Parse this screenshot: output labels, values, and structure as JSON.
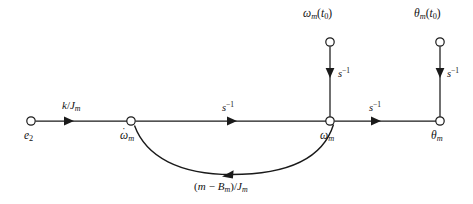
{
  "figure": {
    "kind": "signal-flow-graph",
    "title": "",
    "background_color": "#ffffff",
    "line_color": "#1a1a1a",
    "canvas": {
      "width": 473,
      "height": 204
    }
  },
  "nodes": [
    {
      "id": "e2",
      "label_plain": "e2",
      "label_base": "e",
      "label_sub": "2",
      "role": "source",
      "x": 31,
      "y": 121,
      "label_x": 24,
      "label_y": 130
    },
    {
      "id": "omega_dot_m",
      "label_plain": "omega-dot m",
      "label_base": "ω",
      "label_sub": "m",
      "label_dot": "·",
      "role": "state-node",
      "x": 131,
      "y": 121,
      "label_x": 120,
      "label_y": 130
    },
    {
      "id": "omega_m",
      "label_plain": "omega m",
      "label_base": "ω",
      "label_sub": "m",
      "role": "state-node",
      "x": 330,
      "y": 121,
      "label_x": 320,
      "label_y": 130
    },
    {
      "id": "theta_m",
      "label_plain": "theta m",
      "label_base": "θ",
      "label_sub": "m",
      "role": "output",
      "x": 440,
      "y": 121,
      "label_x": 431,
      "label_y": 130
    },
    {
      "id": "omega_m_t0",
      "label_plain": "omega m (t0)",
      "label_base": "ω",
      "label_sub": "m",
      "label_tail_open": "(",
      "label_tail_var": "t",
      "label_tail_sub": "0",
      "label_tail_close": ")",
      "role": "initial-condition-source",
      "x": 330,
      "y": 42,
      "label_x": 303,
      "label_y": 8
    },
    {
      "id": "theta_m_t0",
      "label_plain": "theta m (t0)",
      "label_base": "θ",
      "label_sub": "m",
      "label_tail_open": "(",
      "label_tail_var": "t",
      "label_tail_sub": "0",
      "label_tail_close": ")",
      "role": "initial-condition-source",
      "x": 440,
      "y": 42,
      "label_x": 414,
      "label_y": 8
    }
  ],
  "branches": [
    {
      "id": "branch-e2-to-omegadot",
      "from": "e2",
      "to": "omega_dot_m",
      "gain_plain": "k/Jm",
      "gain_num": "k",
      "gain_slash": "/",
      "gain_den": "J",
      "gain_den_sub": "m",
      "shape": "straight-horizontal",
      "direction": "right",
      "label_x": 62,
      "label_y": 100
    },
    {
      "id": "branch-omegadot-to-omega",
      "from": "omega_dot_m",
      "to": "omega_m",
      "gain_plain": "s^-1",
      "gain_base": "s",
      "gain_exp": "−1",
      "shape": "straight-horizontal",
      "direction": "right",
      "label_x": 222,
      "label_y": 101
    },
    {
      "id": "branch-omega-to-theta",
      "from": "omega_m",
      "to": "theta_m",
      "gain_plain": "s^-1",
      "gain_base": "s",
      "gain_exp": "−1",
      "shape": "straight-horizontal",
      "direction": "right",
      "label_x": 369,
      "label_y": 101
    },
    {
      "id": "branch-ic-omega",
      "from": "omega_m_t0",
      "to": "omega_m",
      "gain_plain": "s^-1",
      "gain_base": "s",
      "gain_exp": "−1",
      "shape": "straight-vertical",
      "direction": "down",
      "label_x": 338,
      "label_y": 67
    },
    {
      "id": "branch-ic-theta",
      "from": "theta_m_t0",
      "to": "theta_m",
      "gain_plain": "s^-1",
      "gain_base": "s",
      "gain_exp": "−1",
      "shape": "straight-vertical",
      "direction": "down",
      "label_x": 447,
      "label_y": 67
    },
    {
      "id": "branch-feedback",
      "from": "omega_m",
      "to": "omega_dot_m",
      "gain_plain": "(m - Bm)/Jm",
      "gain_open": "(",
      "gain_first": "m",
      "gain_minus": "−",
      "gain_second": "B",
      "gain_second_sub": "m",
      "gain_close": ")",
      "gain_slash": "/",
      "gain_den": "J",
      "gain_den_sub": "m",
      "shape": "curved-arc-below",
      "direction": "left",
      "label_x": 194,
      "label_y": 181
    }
  ]
}
